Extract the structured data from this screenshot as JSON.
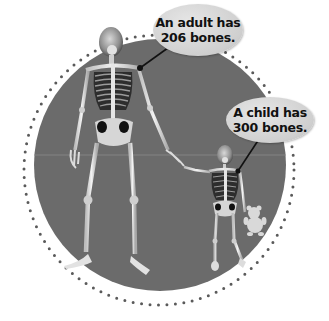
{
  "illustration": {
    "subject": "adult and child skeletons holding hands",
    "colors": {
      "background": "#ffffff",
      "disc": "#6b6b6b",
      "ring_dots": "#5a5a5a",
      "bubble": "#d2d2d2",
      "bone": "#e8e8e8",
      "pointer": "#111111"
    }
  },
  "callouts": [
    {
      "id": "adult",
      "line1": "An adult has",
      "line2": "206 bones."
    },
    {
      "id": "child",
      "line1": "A child has",
      "line2": "300 bones."
    }
  ]
}
